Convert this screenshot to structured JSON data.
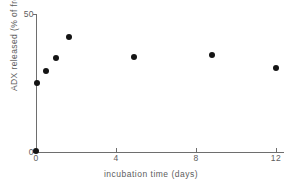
{
  "chart_data": {
    "type": "scatter",
    "title": "",
    "xlabel": "incubation time (days)",
    "ylabel": "ADX released (% of free ADX in MS)",
    "xlim": [
      0,
      12.4
    ],
    "ylim": [
      0,
      50
    ],
    "grid": false,
    "legend": null,
    "xticks": [
      0,
      4,
      8,
      12
    ],
    "xticklabels": [
      "0",
      "4",
      "8",
      "12"
    ],
    "yticks": [
      0,
      50
    ],
    "yticklabels": [
      "0",
      "50"
    ],
    "marker": "filled-circle",
    "marker_color": "#141414",
    "axis_color": "#6e6e6e",
    "points": [
      {
        "x": 0.0,
        "y": 0.4
      },
      {
        "x": 0.05,
        "y": 25.0
      },
      {
        "x": 0.5,
        "y": 29.5
      },
      {
        "x": 1.0,
        "y": 34.0
      },
      {
        "x": 1.65,
        "y": 41.5
      },
      {
        "x": 4.9,
        "y": 34.5
      },
      {
        "x": 8.8,
        "y": 35.0
      },
      {
        "x": 12.0,
        "y": 30.5
      }
    ]
  }
}
